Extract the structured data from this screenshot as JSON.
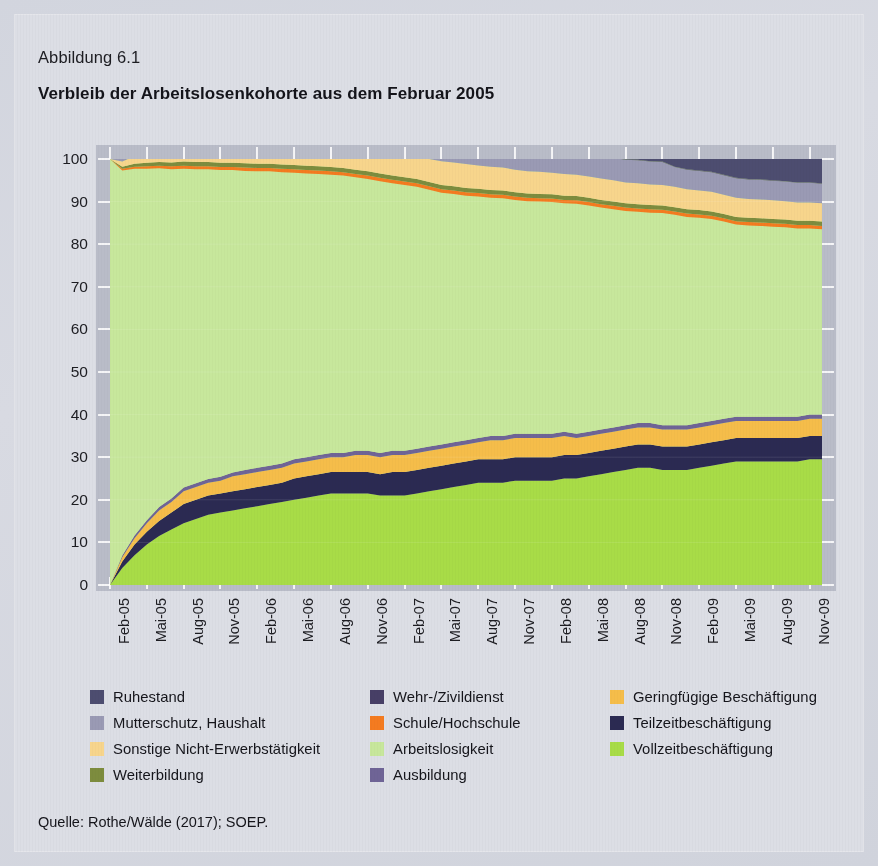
{
  "figure": {
    "number_label": "Abbildung 6.1",
    "title": "Verbleib der Arbeitslosenkohorte aus dem Februar 2005",
    "source": "Quelle: Rothe/Wälde (2017); SOEP."
  },
  "legend": {
    "columns": [
      [
        {
          "label": "Ruhestand",
          "color": "#4d4d70"
        },
        {
          "label": "Mutterschutz, Haushalt",
          "color": "#9a9ab4"
        },
        {
          "label": "Sonstige Nicht-Erwerbstätigkeit",
          "color": "#f7d58c"
        },
        {
          "label": "Weiterbildung",
          "color": "#7d8c3e"
        }
      ],
      [
        {
          "label": "Wehr-/Zivildienst",
          "color": "#473f66"
        },
        {
          "label": "Schule/Hochschule",
          "color": "#f47b20"
        },
        {
          "label": "Arbeitslosigkeit",
          "color": "#c7e79c"
        },
        {
          "label": "Ausbildung",
          "color": "#6f6496"
        }
      ],
      [
        {
          "label": "Geringfügige Beschäftigung",
          "color": "#f5bd4a"
        },
        {
          "label": "Teilzeitbeschäftigung",
          "color": "#2b2a52"
        },
        {
          "label": "Vollzeitbeschäftigung",
          "color": "#a8dc47"
        }
      ]
    ]
  },
  "chart_data": {
    "type": "area",
    "stacked": true,
    "title": "Verbleib der Arbeitslosenkohorte aus dem Februar 2005",
    "xlabel": "",
    "ylabel": "",
    "ylim": [
      0,
      100
    ],
    "yticks": [
      0,
      10,
      20,
      30,
      40,
      50,
      60,
      70,
      80,
      90,
      100
    ],
    "grid": true,
    "legend_position": "below",
    "x": [
      "Feb-05",
      "Mär-05",
      "Apr-05",
      "Mai-05",
      "Jun-05",
      "Jul-05",
      "Aug-05",
      "Sep-05",
      "Okt-05",
      "Nov-05",
      "Dez-05",
      "Jan-06",
      "Feb-06",
      "Mär-06",
      "Apr-06",
      "Mai-06",
      "Jun-06",
      "Jul-06",
      "Aug-06",
      "Sep-06",
      "Okt-06",
      "Nov-06",
      "Dez-06",
      "Jan-07",
      "Feb-07",
      "Mär-07",
      "Apr-07",
      "Mai-07",
      "Jun-07",
      "Jul-07",
      "Aug-07",
      "Sep-07",
      "Okt-07",
      "Nov-07",
      "Dez-07",
      "Jan-08",
      "Feb-08",
      "Mär-08",
      "Apr-08",
      "Mai-08",
      "Jun-08",
      "Jul-08",
      "Aug-08",
      "Sep-08",
      "Okt-08",
      "Nov-08",
      "Dez-08",
      "Jan-09",
      "Feb-09",
      "Mär-09",
      "Apr-09",
      "Mai-09",
      "Jun-09",
      "Jul-09",
      "Aug-09",
      "Sep-09",
      "Okt-09",
      "Nov-09",
      "Dez-09"
    ],
    "xtick_labels": [
      "Feb-05",
      "Mai-05",
      "Aug-05",
      "Nov-05",
      "Feb-06",
      "Mai-06",
      "Aug-06",
      "Nov-06",
      "Feb-07",
      "Mai-07",
      "Aug-07",
      "Nov-07",
      "Feb-08",
      "Mai-08",
      "Aug-08",
      "Nov-08",
      "Feb-09",
      "Mai-09",
      "Aug-09",
      "Nov-09"
    ],
    "xtick_indices": [
      0,
      3,
      6,
      9,
      12,
      15,
      18,
      21,
      24,
      27,
      30,
      33,
      36,
      39,
      42,
      45,
      48,
      51,
      54,
      57
    ],
    "series": [
      {
        "name": "Vollzeitbeschäftigung",
        "color": "#a8dc47",
        "values": [
          0,
          4,
          7,
          9.5,
          11.5,
          13,
          14.5,
          15.5,
          16.5,
          17,
          17.5,
          18,
          18.5,
          19,
          19.5,
          20,
          20.5,
          21,
          21.5,
          21.5,
          21.5,
          21.5,
          21,
          21,
          21,
          21.5,
          22,
          22.5,
          23,
          23.5,
          24,
          24,
          24,
          24.5,
          24.5,
          24.5,
          24.5,
          25,
          25,
          25.5,
          26,
          26.5,
          27,
          27.5,
          27.5,
          27,
          27,
          27,
          27.5,
          28,
          28.5,
          29,
          29,
          29,
          29,
          29,
          29,
          29.5,
          29.5
        ]
      },
      {
        "name": "Teilzeitbeschäftigung",
        "color": "#2b2a52",
        "values": [
          0,
          1.5,
          2.5,
          3,
          3.5,
          4,
          4.5,
          4.5,
          4.5,
          4.5,
          4.5,
          4.5,
          4.5,
          4.5,
          4.5,
          5,
          5,
          5,
          5,
          5,
          5,
          5,
          5,
          5.5,
          5.5,
          5.5,
          5.5,
          5.5,
          5.5,
          5.5,
          5.5,
          5.5,
          5.5,
          5.5,
          5.5,
          5.5,
          5.5,
          5.5,
          5.5,
          5.5,
          5.5,
          5.5,
          5.5,
          5.5,
          5.5,
          5.5,
          5.5,
          5.5,
          5.5,
          5.5,
          5.5,
          5.5,
          5.5,
          5.5,
          5.5,
          5.5,
          5.5,
          5.5,
          5.5
        ]
      },
      {
        "name": "Geringfügige Beschäftigung",
        "color": "#f5bd4a",
        "values": [
          0,
          1,
          1.5,
          2,
          2.5,
          2.5,
          3,
          3,
          3,
          3,
          3.5,
          3.5,
          3.5,
          3.5,
          3.5,
          3.5,
          3.5,
          3.5,
          3.5,
          3.5,
          4,
          4,
          4,
          4,
          4,
          4,
          4,
          4,
          4,
          4,
          4,
          4.5,
          4.5,
          4.5,
          4.5,
          4.5,
          4.5,
          4.5,
          4,
          4,
          4,
          4,
          4,
          4,
          4,
          4,
          4,
          4,
          4,
          4,
          4,
          4,
          4,
          4,
          4,
          4,
          4,
          4,
          4
        ]
      },
      {
        "name": "Ausbildung",
        "color": "#6f6496",
        "values": [
          0,
          0.4,
          0.6,
          0.7,
          0.8,
          0.8,
          0.9,
          0.9,
          0.9,
          0.9,
          0.9,
          1,
          1,
          1,
          1,
          1,
          1,
          1,
          1,
          1,
          1,
          1,
          1,
          1,
          1,
          1,
          1,
          1,
          1,
          1,
          1,
          1,
          1,
          1,
          1,
          1,
          1,
          1,
          1,
          1,
          1,
          1,
          1,
          1,
          1,
          1,
          1,
          1,
          1,
          1,
          1,
          1,
          1,
          1,
          1,
          1,
          1,
          1,
          1
        ]
      },
      {
        "name": "Arbeitslosigkeit",
        "color": "#c7e79c",
        "values": [
          100,
          90.4,
          86.1,
          82.5,
          79.5,
          77.3,
          74.8,
          73.7,
          72.7,
          72,
          71,
          70.2,
          69.6,
          69.1,
          68.4,
          67.3,
          66.6,
          66,
          65.3,
          65.1,
          64.2,
          63.8,
          63.8,
          62.8,
          62.4,
          61.5,
          60.3,
          59.1,
          58.3,
          57.4,
          56.7,
          55.9,
          55.8,
          54.9,
          54.6,
          54.5,
          54.4,
          53.6,
          54,
          53.1,
          52.1,
          51.2,
          50.3,
          49.6,
          49.4,
          49.8,
          49.4,
          48.9,
          48.2,
          47.4,
          46.3,
          45.1,
          44.9,
          44.8,
          44.6,
          44.5,
          44.2,
          43.7,
          43.5
        ]
      },
      {
        "name": "Schule/Hochschule",
        "color": "#f47b20",
        "values": [
          0,
          0.4,
          0.5,
          0.6,
          0.6,
          0.7,
          0.7,
          0.7,
          0.7,
          0.7,
          0.7,
          0.8,
          0.8,
          0.8,
          0.8,
          0.8,
          0.8,
          0.8,
          0.8,
          0.8,
          0.8,
          0.8,
          0.8,
          0.8,
          0.8,
          0.8,
          0.8,
          0.8,
          0.8,
          0.8,
          0.8,
          0.8,
          0.8,
          0.8,
          0.8,
          0.8,
          0.8,
          0.8,
          0.8,
          0.8,
          0.8,
          0.8,
          0.8,
          0.8,
          0.8,
          0.8,
          0.8,
          0.8,
          0.8,
          0.8,
          0.8,
          0.8,
          0.8,
          0.8,
          0.8,
          0.8,
          0.8,
          0.8,
          0.8
        ]
      },
      {
        "name": "Weiterbildung",
        "color": "#7d8c3e",
        "values": [
          0,
          0.5,
          0.7,
          0.8,
          0.9,
          0.9,
          1,
          1,
          1,
          1,
          1,
          1,
          1,
          1,
          1,
          1,
          1,
          1,
          1,
          1,
          1,
          1,
          1,
          1,
          1,
          1,
          1,
          1,
          1,
          1,
          1,
          1,
          1,
          1,
          1,
          1,
          1,
          1,
          1,
          1,
          1,
          1,
          1,
          1,
          1,
          1,
          1,
          1,
          1,
          1,
          1,
          1,
          1,
          1,
          1,
          1,
          1,
          1,
          1
        ]
      },
      {
        "name": "Sonstige Nicht-Erwerbstätigkeit",
        "color": "#f7d58c",
        "values": [
          0,
          1.2,
          1.8,
          2.2,
          2.5,
          2.8,
          3,
          3.2,
          3.4,
          3.5,
          3.6,
          3.7,
          3.8,
          3.9,
          4,
          4.1,
          4.2,
          4.3,
          4.4,
          4.5,
          4.6,
          4.7,
          4.8,
          4.9,
          5,
          5.2,
          5.4,
          5.6,
          5.6,
          5.6,
          5.5,
          5.5,
          5.4,
          5.3,
          5.2,
          5.2,
          5.1,
          5.1,
          5,
          5,
          5,
          5,
          4.9,
          4.9,
          4.8,
          4.8,
          4.8,
          4.7,
          4.6,
          4.6,
          4.5,
          4.5,
          4.4,
          4.4,
          4.4,
          4.3,
          4.3,
          4.3,
          4.3
        ]
      },
      {
        "name": "Mutterschutz, Haushalt",
        "color": "#9a9ab4",
        "values": [
          0,
          0.6,
          1,
          1.4,
          1.7,
          2,
          2.2,
          2.4,
          2.6,
          2.9,
          3.1,
          3.3,
          3.5,
          3.7,
          3.9,
          4.1,
          4.3,
          4.5,
          4.7,
          4.9,
          5.1,
          5.3,
          5.4,
          5.5,
          5.6,
          5.7,
          5.8,
          5.8,
          5.8,
          5.8,
          5.8,
          5.8,
          5.8,
          5.9,
          5.9,
          5.9,
          5.2,
          5.2,
          5.2,
          5.2,
          5.3,
          5.3,
          5.3,
          5.4,
          5.4,
          5.4,
          4.6,
          4.6,
          4.6,
          4.6,
          4.6,
          4.6,
          4.6,
          4.6,
          4.6,
          4.6,
          4.6,
          4.6,
          4.6
        ]
      },
      {
        "name": "Wehr-/Zivildienst",
        "color": "#473f66",
        "values": [
          0,
          0.1,
          0.1,
          0.1,
          0.1,
          0.1,
          0.1,
          0.1,
          0.1,
          0.1,
          0.1,
          0.1,
          0.1,
          0.1,
          0.1,
          0.1,
          0.1,
          0.1,
          0.1,
          0.1,
          0.1,
          0.1,
          0.1,
          0.1,
          0.1,
          0.1,
          0.1,
          0.1,
          0.1,
          0.1,
          0.1,
          0.1,
          0.1,
          0.1,
          0.1,
          0.1,
          0.1,
          0.1,
          0.1,
          0.1,
          0.1,
          0.1,
          0.1,
          0.1,
          0.1,
          0.1,
          0.1,
          0.1,
          0.1,
          0.1,
          0.1,
          0.1,
          0.1,
          0.1,
          0.1,
          0.1,
          0.1,
          0.1,
          0.1
        ]
      },
      {
        "name": "Ruhestand",
        "color": "#4d4d70",
        "values": [
          0,
          0.3,
          0.8,
          1.3,
          1.8,
          2.3,
          2.8,
          3.2,
          3.6,
          4,
          4.2,
          4.4,
          4.6,
          4.8,
          5.1,
          5.4,
          5.6,
          5.8,
          6,
          6.0,
          6.4,
          6.6,
          6.8,
          7.2,
          7.4,
          7.6,
          8.0,
          8.5,
          8.9,
          9.3,
          9.6,
          10.0,
          10.2,
          10.5,
          10.7,
          10.8,
          11.9,
          12.2,
          12.3,
          12.8,
          13.2,
          13.6,
          14.1,
          14.2,
          14.7,
          14.6,
          15.8,
          16.2,
          16.6,
          17.0,
          17.6,
          18.3,
          18.6,
          18.9,
          19.1,
          19.2,
          19.5,
          20.0,
          20.2
        ]
      }
    ]
  }
}
